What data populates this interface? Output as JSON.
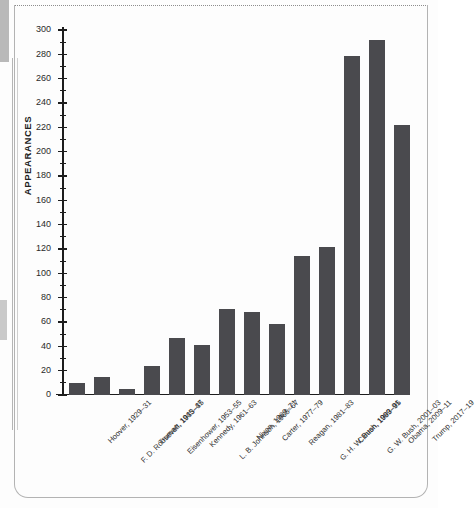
{
  "chart_data": {
    "type": "bar",
    "title": "",
    "subtitle": "",
    "xlabel": "",
    "ylabel": "APPEARANCES",
    "ylim": [
      0,
      300
    ],
    "ytick_step": 20,
    "yminor_step": 10,
    "grid": false,
    "legend": null,
    "bar_color": "#4a4a4e",
    "axis_color": "#1d1d1d",
    "categories": [
      "Hoover, 1929–31",
      "F. D. Roosevelt, 1933–35",
      "Truman, 1945–47",
      "Eisenhower, 1953–55",
      "Kennedy, 1961–63",
      "L. B. Johnson, 1965–67",
      "Nixon, 1969–71",
      "Carter, 1977–79",
      "Reagan, 1981–83",
      "G. H. W. Bush, 1989–91",
      "Clinton, 1993–95",
      "G. W. Bush, 2001–03",
      "Obama, 2009–11",
      "Trump, 2017–19"
    ],
    "values": [
      10,
      15,
      5,
      24,
      47,
      41,
      71,
      68,
      58,
      114,
      122,
      279,
      292,
      222
    ],
    "ytick_labels": [
      "0",
      "20",
      "40",
      "60",
      "80",
      "100",
      "120",
      "140",
      "160",
      "180",
      "200",
      "220",
      "240",
      "260",
      "280",
      "300"
    ],
    "ytick_values": [
      0,
      20,
      40,
      60,
      80,
      100,
      120,
      140,
      160,
      180,
      200,
      220,
      240,
      260,
      280,
      300
    ]
  }
}
